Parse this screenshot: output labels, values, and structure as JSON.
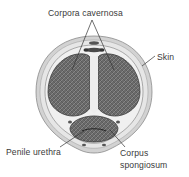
{
  "labels": {
    "corpora_cavernosa": "Corpora cavernosa",
    "skin": "Skin",
    "penile_urethra": "Penile urethra",
    "corpus_spongiosum_line1": "Corpus",
    "corpus_spongiosum_line2": "spongiosum"
  },
  "colors": {
    "skin_outer": "#cfcfcf",
    "skin_band": "#e4e4e4",
    "tissue": "#5e5e5e",
    "septum": "#ececec",
    "leader_line": "#333333",
    "text": "#3a3a3a"
  }
}
